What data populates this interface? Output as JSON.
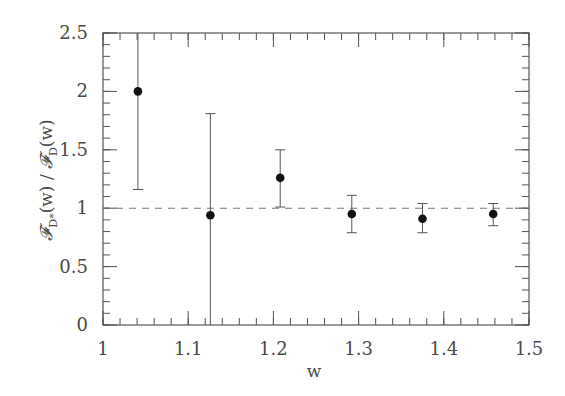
{
  "chart_data": {
    "type": "scatter",
    "title": "",
    "xlabel": "w",
    "ylabel": "𝓕_D*(w) / 𝓕_D(w)",
    "xlim": [
      1.0,
      1.5
    ],
    "ylim": [
      0,
      2.5
    ],
    "x_ticks": [
      1,
      1.1,
      1.2,
      1.3,
      1.4,
      1.5
    ],
    "x_tick_labels": [
      "1",
      "1.1",
      "1.2",
      "1.3",
      "1.4",
      "1.5"
    ],
    "y_ticks": [
      0,
      0.5,
      1,
      1.5,
      2,
      2.5
    ],
    "y_tick_labels": [
      "0",
      "0.5",
      "1",
      "1.5",
      "2",
      "2.5"
    ],
    "x_minor_step": 0.02,
    "y_minor_step": 0.1,
    "grid": false,
    "legend": null,
    "series": [
      {
        "name": "ratio",
        "marker": "filled-circle",
        "color": "#111111",
        "points": [
          {
            "x": 1.041,
            "y": 2.0,
            "y_err_low": 1.16,
            "y_err_high": 2.5
          },
          {
            "x": 1.126,
            "y": 0.94,
            "y_err_low": 0.0,
            "y_err_high": 1.81
          },
          {
            "x": 1.208,
            "y": 1.26,
            "y_err_low": 1.01,
            "y_err_high": 1.5
          },
          {
            "x": 1.292,
            "y": 0.95,
            "y_err_low": 0.79,
            "y_err_high": 1.11
          },
          {
            "x": 1.375,
            "y": 0.91,
            "y_err_low": 0.79,
            "y_err_high": 1.04
          },
          {
            "x": 1.458,
            "y": 0.95,
            "y_err_low": 0.85,
            "y_err_high": 1.04
          }
        ]
      }
    ],
    "reference_lines": [
      {
        "orientation": "horizontal",
        "y": 1.0,
        "style": "dashed",
        "color": "#777777"
      }
    ]
  },
  "labels": {
    "x_axis": "w",
    "y_axis_script_num": "𝓕",
    "y_axis_sub_num": "D*",
    "y_axis_arg": "(w)",
    "y_axis_slash": " / ",
    "y_axis_script_den": "𝓕",
    "y_axis_sub_den": "D",
    "y_axis_arg_den": "(w)"
  }
}
